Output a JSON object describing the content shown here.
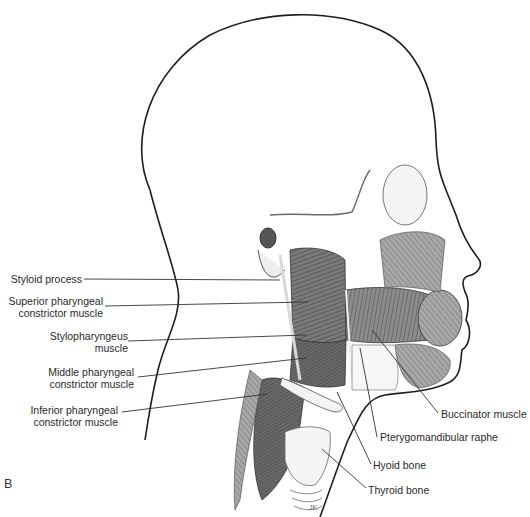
{
  "figure": {
    "panel_letter": "B",
    "colors": {
      "background": "#ffffff",
      "outline": "#1e1e1e",
      "muscle_dark": "#5a5a5a",
      "muscle_mid": "#8a8a8a",
      "muscle_light": "#bdbdbd",
      "bone": "#f2f2f2",
      "label_text": "#2a2a2a",
      "leader_line": "#333333"
    }
  },
  "labels_left": [
    {
      "id": "styloid",
      "lines": [
        "Styloid process"
      ],
      "x": 112,
      "y": 272
    },
    {
      "id": "superior",
      "lines": [
        "Superior pharyngeal",
        "constrictor muscle"
      ],
      "x": 102,
      "y": 298
    },
    {
      "id": "stylopharyngeus",
      "lines": [
        "Stylopharyngeus",
        "muscle"
      ],
      "x": 128,
      "y": 334
    },
    {
      "id": "middle",
      "lines": [
        "Middle pharyngeal",
        "constrictor muscle"
      ],
      "x": 133,
      "y": 369
    },
    {
      "id": "inferior",
      "lines": [
        "Inferior pharyngeal",
        "constrictor muscle"
      ],
      "x": 118,
      "y": 405
    }
  ],
  "labels_right": [
    {
      "id": "buccinator",
      "lines": [
        "Buccinator muscle"
      ],
      "x": 441,
      "y": 409
    },
    {
      "id": "pterygomandibular",
      "lines": [
        "Pterygomandibular raphe"
      ],
      "x": 379,
      "y": 432
    },
    {
      "id": "hyoid",
      "lines": [
        "Hyoid bone"
      ],
      "x": 373,
      "y": 460
    },
    {
      "id": "thyroid",
      "lines": [
        "Thyroid bone"
      ],
      "x": 368,
      "y": 485
    }
  ]
}
